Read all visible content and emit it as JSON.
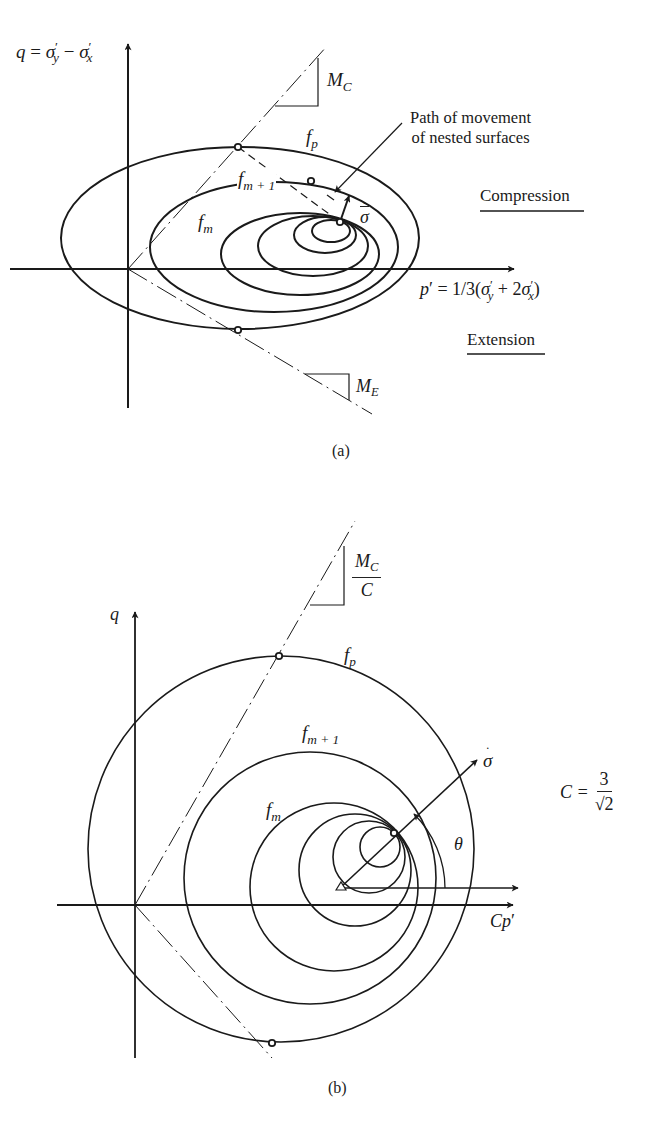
{
  "figure": {
    "panel_a": {
      "caption": "(a)",
      "y_axis_label": {
        "var": "q",
        "eq": "=",
        "t1": "σ",
        "t1_sub": "y",
        "minus": "−",
        "t2": "σ",
        "t2_sub": "x",
        "prime": "′"
      },
      "x_axis_label": {
        "var": "p",
        "prime": "′",
        "eq": "= 1/3(",
        "t1": "σ",
        "t1_sub": "y",
        "plus": "+  2",
        "t2": "σ",
        "t2_sub": "x",
        "close": ")"
      },
      "mc_label": {
        "main": "M",
        "sub": "C"
      },
      "me_label": {
        "main": "M",
        "sub": "E"
      },
      "fp_label": {
        "main": "f",
        "sub": "p"
      },
      "fm1_label": {
        "main": "f",
        "sub": "m + 1"
      },
      "fm_label": {
        "main": "f",
        "sub": "m"
      },
      "sigma_dot_label": "σ",
      "annotation_line1": "Path of movement",
      "annotation_line2": "of nested surfaces",
      "compression_label": "Compression",
      "extension_label": "Extension"
    },
    "panel_b": {
      "caption": "(b)",
      "y_axis_label": "q",
      "x_axis_label": {
        "main": "Cp",
        "prime": "′"
      },
      "mc_label": {
        "num_main": "M",
        "num_sub": "C",
        "den": "C"
      },
      "fp_label": {
        "main": "f",
        "sub": "p"
      },
      "fm1_label": {
        "main": "f",
        "sub": "m + 1"
      },
      "fm_label": {
        "main": "f",
        "sub": "m"
      },
      "sigma_dot_label": "σ",
      "theta_label": "θ",
      "c_def": {
        "lhs": "C =",
        "num": "3",
        "den": "√2"
      }
    },
    "colors": {
      "ink": "#1a1a1a",
      "background": "#ffffff"
    }
  }
}
